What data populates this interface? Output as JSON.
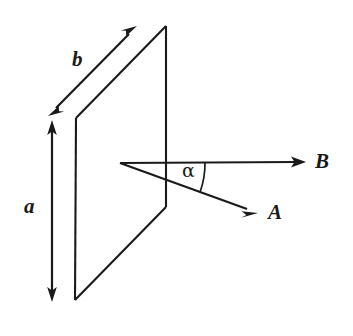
{
  "figure": {
    "background_color": "#ffffff",
    "ink_color": "#1a1a1a",
    "labels": {
      "side_a": "a",
      "side_b": "b",
      "vector_a": "A",
      "vector_b": "B",
      "angle": "α"
    },
    "geometry": {
      "plane": {
        "name": "rectangular-plane-parallelogram",
        "points": "76,118 166,26 166,207 75,300"
      },
      "dimension_a": {
        "name": "height-dimension-arrow",
        "from": "52,122",
        "to": "52,300",
        "double_headed": true
      },
      "dimension_b": {
        "name": "width-dimension-arrow",
        "from": "50,114",
        "to": "135,28",
        "double_headed": true
      },
      "vector_B": {
        "name": "vector-b-arrow",
        "from": "120,163",
        "to": "305,162",
        "double_headed": false
      },
      "vector_A": {
        "name": "vector-a-arrow",
        "from": "120,163",
        "to": "257,213",
        "double_headed": false
      },
      "angle_arc": {
        "name": "angle-alpha-arc",
        "center": "120,163",
        "radius": 85,
        "start_deg": 0,
        "end_deg": 20
      }
    }
  }
}
